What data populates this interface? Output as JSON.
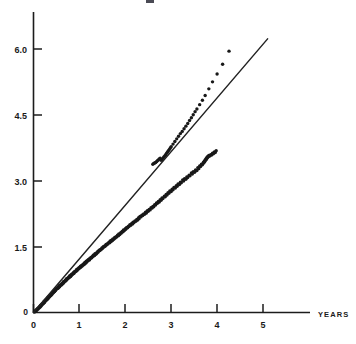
{
  "figure": {
    "width": 356,
    "height": 344,
    "background": "#ffffff",
    "ink_color": "#1c1c1c"
  },
  "axes": {
    "x_axis_name": "YEARS",
    "y_axis_name": "",
    "x_tick_labels": [
      "0",
      "1",
      "2",
      "3",
      "4",
      "5"
    ],
    "y_tick_labels": [
      "0",
      "1.5",
      "3.0",
      "4.5",
      "6.0"
    ],
    "origin_label": "0"
  },
  "chart_data": {
    "type": "scatter",
    "title": "",
    "xlabel": "YEARS",
    "ylabel": "",
    "xlim": [
      0,
      5.6
    ],
    "ylim": [
      0,
      6.4
    ],
    "xticks": [
      0,
      1,
      2,
      3,
      4,
      5
    ],
    "yticks": [
      0,
      1.5,
      3.0,
      4.5,
      6.0
    ],
    "xtick_labels": [
      "0",
      "1",
      "2",
      "3",
      "4",
      "5"
    ],
    "ytick_labels": [
      "0",
      "1.5",
      "3.0",
      "4.5",
      "6.0"
    ],
    "grid": false,
    "legend": null,
    "series": [
      {
        "name": "observations",
        "kind": "scatter",
        "marker": "dot",
        "color": "#181818",
        "marker_size": 1.7,
        "points": [
          [
            0.02,
            0.01
          ],
          [
            0.03,
            0.03
          ],
          [
            0.04,
            0.02
          ],
          [
            0.05,
            0.05
          ],
          [
            0.06,
            0.04
          ],
          [
            0.07,
            0.07
          ],
          [
            0.08,
            0.06
          ],
          [
            0.09,
            0.09
          ],
          [
            0.1,
            0.08
          ],
          [
            0.11,
            0.11
          ],
          [
            0.12,
            0.1
          ],
          [
            0.13,
            0.13
          ],
          [
            0.14,
            0.12
          ],
          [
            0.15,
            0.16
          ],
          [
            0.16,
            0.14
          ],
          [
            0.17,
            0.18
          ],
          [
            0.18,
            0.17
          ],
          [
            0.19,
            0.2
          ],
          [
            0.2,
            0.19
          ],
          [
            0.21,
            0.22
          ],
          [
            0.22,
            0.21
          ],
          [
            0.23,
            0.25
          ],
          [
            0.24,
            0.23
          ],
          [
            0.25,
            0.27
          ],
          [
            0.26,
            0.26
          ],
          [
            0.27,
            0.29
          ],
          [
            0.28,
            0.28
          ],
          [
            0.29,
            0.31
          ],
          [
            0.3,
            0.3
          ],
          [
            0.31,
            0.34
          ],
          [
            0.32,
            0.32
          ],
          [
            0.33,
            0.36
          ],
          [
            0.34,
            0.35
          ],
          [
            0.35,
            0.38
          ],
          [
            0.36,
            0.37
          ],
          [
            0.37,
            0.4
          ],
          [
            0.38,
            0.39
          ],
          [
            0.39,
            0.43
          ],
          [
            0.4,
            0.41
          ],
          [
            0.41,
            0.45
          ],
          [
            0.42,
            0.44
          ],
          [
            0.43,
            0.47
          ],
          [
            0.44,
            0.46
          ],
          [
            0.45,
            0.49
          ],
          [
            0.46,
            0.48
          ],
          [
            0.47,
            0.52
          ],
          [
            0.48,
            0.5
          ],
          [
            0.49,
            0.54
          ],
          [
            0.5,
            0.53
          ],
          [
            0.52,
            0.56
          ],
          [
            0.53,
            0.55
          ],
          [
            0.54,
            0.58
          ],
          [
            0.55,
            0.57
          ],
          [
            0.56,
            0.61
          ],
          [
            0.57,
            0.59
          ],
          [
            0.58,
            0.63
          ],
          [
            0.6,
            0.62
          ],
          [
            0.61,
            0.65
          ],
          [
            0.62,
            0.64
          ],
          [
            0.63,
            0.67
          ],
          [
            0.64,
            0.66
          ],
          [
            0.65,
            0.7
          ],
          [
            0.66,
            0.68
          ],
          [
            0.68,
            0.72
          ],
          [
            0.69,
            0.71
          ],
          [
            0.7,
            0.74
          ],
          [
            0.71,
            0.73
          ],
          [
            0.72,
            0.77
          ],
          [
            0.73,
            0.75
          ],
          [
            0.75,
            0.79
          ],
          [
            0.76,
            0.78
          ],
          [
            0.77,
            0.81
          ],
          [
            0.78,
            0.8
          ],
          [
            0.79,
            0.84
          ],
          [
            0.81,
            0.82
          ],
          [
            0.82,
            0.86
          ],
          [
            0.83,
            0.85
          ],
          [
            0.84,
            0.88
          ],
          [
            0.85,
            0.87
          ],
          [
            0.87,
            0.91
          ],
          [
            0.88,
            0.89
          ],
          [
            0.89,
            0.93
          ],
          [
            0.9,
            0.92
          ],
          [
            0.92,
            0.95
          ],
          [
            0.93,
            0.94
          ],
          [
            0.94,
            0.98
          ],
          [
            0.95,
            0.96
          ],
          [
            0.97,
            1.0
          ],
          [
            0.98,
            0.99
          ],
          [
            0.99,
            1.02
          ],
          [
            1.0,
            1.01
          ],
          [
            1.02,
            1.05
          ],
          [
            1.03,
            1.03
          ],
          [
            1.04,
            1.07
          ],
          [
            1.06,
            1.06
          ],
          [
            1.07,
            1.09
          ],
          [
            1.08,
            1.08
          ],
          [
            1.1,
            1.12
          ],
          [
            1.11,
            1.1
          ],
          [
            1.12,
            1.14
          ],
          [
            1.14,
            1.13
          ],
          [
            1.15,
            1.17
          ],
          [
            1.16,
            1.15
          ],
          [
            1.18,
            1.19
          ],
          [
            1.19,
            1.18
          ],
          [
            1.2,
            1.21
          ],
          [
            1.22,
            1.2
          ],
          [
            1.23,
            1.24
          ],
          [
            1.24,
            1.23
          ],
          [
            1.26,
            1.26
          ],
          [
            1.27,
            1.25
          ],
          [
            1.29,
            1.29
          ],
          [
            1.3,
            1.28
          ],
          [
            1.31,
            1.31
          ],
          [
            1.33,
            1.3
          ],
          [
            1.34,
            1.34
          ],
          [
            1.36,
            1.33
          ],
          [
            1.37,
            1.36
          ],
          [
            1.38,
            1.35
          ],
          [
            1.4,
            1.39
          ],
          [
            1.41,
            1.38
          ],
          [
            1.43,
            1.42
          ],
          [
            1.44,
            1.41
          ],
          [
            1.46,
            1.44
          ],
          [
            1.47,
            1.43
          ],
          [
            1.49,
            1.47
          ],
          [
            1.5,
            1.46
          ],
          [
            1.52,
            1.5
          ],
          [
            1.53,
            1.49
          ],
          [
            1.55,
            1.52
          ],
          [
            1.56,
            1.51
          ],
          [
            1.58,
            1.55
          ],
          [
            1.59,
            1.54
          ],
          [
            1.61,
            1.57
          ],
          [
            1.62,
            1.56
          ],
          [
            1.64,
            1.6
          ],
          [
            1.66,
            1.59
          ],
          [
            1.67,
            1.63
          ],
          [
            1.69,
            1.62
          ],
          [
            1.7,
            1.65
          ],
          [
            1.72,
            1.64
          ],
          [
            1.73,
            1.68
          ],
          [
            1.75,
            1.67
          ],
          [
            1.77,
            1.71
          ],
          [
            1.78,
            1.7
          ],
          [
            1.8,
            1.73
          ],
          [
            1.81,
            1.72
          ],
          [
            1.83,
            1.76
          ],
          [
            1.85,
            1.75
          ],
          [
            1.86,
            1.79
          ],
          [
            1.88,
            1.78
          ],
          [
            1.9,
            1.82
          ],
          [
            1.91,
            1.81
          ],
          [
            1.93,
            1.85
          ],
          [
            1.95,
            1.84
          ],
          [
            1.96,
            1.88
          ],
          [
            1.98,
            1.87
          ],
          [
            2.0,
            1.91
          ],
          [
            2.01,
            1.9
          ],
          [
            2.03,
            1.94
          ],
          [
            2.05,
            1.93
          ],
          [
            2.07,
            1.97
          ],
          [
            2.08,
            1.96
          ],
          [
            2.1,
            2.0
          ],
          [
            2.12,
            1.99
          ],
          [
            2.14,
            2.03
          ],
          [
            2.16,
            2.02
          ],
          [
            2.17,
            2.06
          ],
          [
            2.19,
            2.05
          ],
          [
            2.21,
            2.09
          ],
          [
            2.23,
            2.08
          ],
          [
            2.25,
            2.12
          ],
          [
            2.27,
            2.11
          ],
          [
            2.29,
            2.16
          ],
          [
            2.3,
            2.14
          ],
          [
            2.32,
            2.19
          ],
          [
            2.34,
            2.18
          ],
          [
            2.36,
            2.22
          ],
          [
            2.38,
            2.21
          ],
          [
            2.4,
            2.25
          ],
          [
            2.42,
            2.24
          ],
          [
            2.44,
            2.29
          ],
          [
            2.46,
            2.27
          ],
          [
            2.48,
            2.32
          ],
          [
            2.5,
            2.31
          ],
          [
            2.52,
            2.35
          ],
          [
            2.54,
            2.34
          ],
          [
            2.56,
            2.39
          ],
          [
            2.58,
            2.38
          ],
          [
            2.6,
            2.42
          ],
          [
            2.62,
            2.41
          ],
          [
            2.64,
            2.46
          ],
          [
            2.66,
            2.45
          ],
          [
            2.68,
            2.5
          ],
          [
            2.7,
            2.49
          ],
          [
            2.72,
            2.53
          ],
          [
            2.74,
            2.52
          ],
          [
            2.76,
            2.57
          ],
          [
            2.78,
            2.56
          ],
          [
            2.8,
            2.61
          ],
          [
            2.82,
            2.6
          ],
          [
            2.85,
            2.65
          ],
          [
            2.87,
            2.64
          ],
          [
            2.89,
            2.69
          ],
          [
            2.91,
            2.68
          ],
          [
            2.93,
            2.73
          ],
          [
            2.95,
            2.72
          ],
          [
            2.97,
            2.77
          ],
          [
            3.0,
            2.76
          ],
          [
            3.02,
            2.81
          ],
          [
            3.04,
            2.8
          ],
          [
            3.06,
            2.85
          ],
          [
            3.09,
            2.84
          ],
          [
            3.11,
            2.89
          ],
          [
            3.13,
            2.88
          ],
          [
            3.15,
            2.93
          ],
          [
            3.18,
            2.92
          ],
          [
            3.2,
            2.97
          ],
          [
            3.22,
            2.96
          ],
          [
            3.25,
            3.02
          ],
          [
            3.27,
            3.0
          ],
          [
            3.29,
            3.05
          ],
          [
            3.32,
            3.04
          ],
          [
            3.34,
            3.09
          ],
          [
            3.36,
            3.08
          ],
          [
            3.39,
            3.13
          ],
          [
            3.41,
            3.12
          ],
          [
            3.44,
            3.18
          ],
          [
            3.46,
            3.16
          ],
          [
            3.48,
            3.21
          ],
          [
            3.51,
            3.2
          ],
          [
            3.53,
            3.25
          ],
          [
            3.56,
            3.24
          ],
          [
            3.58,
            3.3
          ],
          [
            3.6,
            3.28
          ],
          [
            3.62,
            3.34
          ],
          [
            3.64,
            3.33
          ],
          [
            3.66,
            3.38
          ],
          [
            3.68,
            3.37
          ],
          [
            3.7,
            3.42
          ],
          [
            3.71,
            3.41
          ],
          [
            3.72,
            3.45
          ],
          [
            3.73,
            3.44
          ],
          [
            3.74,
            3.48
          ],
          [
            3.75,
            3.47
          ],
          [
            3.76,
            3.51
          ],
          [
            3.77,
            3.5
          ],
          [
            3.78,
            3.54
          ],
          [
            3.79,
            3.53
          ],
          [
            3.8,
            3.56
          ],
          [
            3.81,
            3.55
          ],
          [
            3.82,
            3.58
          ],
          [
            3.84,
            3.57
          ],
          [
            3.86,
            3.6
          ],
          [
            3.88,
            3.59
          ],
          [
            3.9,
            3.63
          ],
          [
            3.92,
            3.62
          ],
          [
            3.94,
            3.66
          ],
          [
            3.96,
            3.65
          ],
          [
            3.98,
            3.69
          ],
          [
            2.66,
            3.42
          ],
          [
            2.68,
            3.44
          ],
          [
            2.7,
            3.46
          ],
          [
            2.72,
            3.48
          ],
          [
            2.74,
            3.5
          ],
          [
            2.76,
            3.52
          ],
          [
            2.6,
            3.38
          ],
          [
            2.62,
            3.4
          ],
          [
            2.64,
            3.41
          ],
          [
            2.78,
            3.47
          ],
          [
            2.8,
            3.49
          ],
          [
            2.82,
            3.52
          ],
          [
            2.84,
            3.55
          ],
          [
            2.86,
            3.57
          ],
          [
            2.88,
            3.6
          ],
          [
            2.9,
            3.63
          ],
          [
            2.92,
            3.66
          ],
          [
            2.94,
            3.69
          ],
          [
            2.96,
            3.72
          ],
          [
            2.98,
            3.75
          ],
          [
            3.0,
            3.78
          ],
          [
            3.04,
            3.84
          ],
          [
            3.08,
            3.9
          ],
          [
            3.12,
            3.96
          ],
          [
            3.16,
            4.02
          ],
          [
            3.2,
            4.08
          ],
          [
            3.24,
            4.13
          ],
          [
            3.28,
            4.19
          ],
          [
            3.32,
            4.25
          ],
          [
            3.36,
            4.31
          ],
          [
            3.4,
            4.38
          ],
          [
            3.44,
            4.44
          ],
          [
            3.48,
            4.51
          ],
          [
            3.52,
            4.58
          ],
          [
            3.56,
            4.64
          ],
          [
            3.62,
            4.74
          ],
          [
            3.68,
            4.84
          ],
          [
            3.74,
            4.95
          ],
          [
            3.82,
            5.1
          ],
          [
            3.9,
            5.26
          ],
          [
            4.0,
            5.44
          ],
          [
            4.12,
            5.66
          ],
          [
            4.26,
            5.96
          ]
        ]
      },
      {
        "name": "reference-line",
        "kind": "line",
        "color": "#222222",
        "from": [
          0.0,
          0.0
        ],
        "to": [
          5.1,
          6.24
        ]
      }
    ]
  }
}
